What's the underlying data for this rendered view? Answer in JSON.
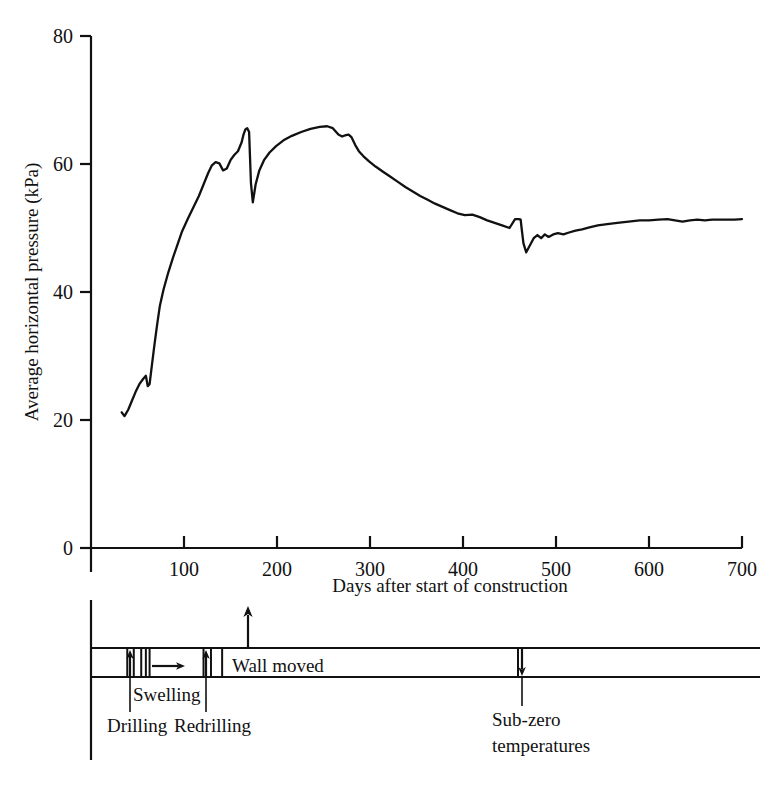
{
  "chart_data": {
    "type": "line",
    "title": "",
    "xlabel": "Days after start of construction",
    "ylabel": "Average horizontal pressure (kPa)",
    "xlim": [
      0,
      700
    ],
    "ylim": [
      0,
      80
    ],
    "xticks": [
      0,
      100,
      200,
      300,
      400,
      500,
      600,
      700
    ],
    "yticks": [
      0,
      20,
      40,
      60,
      80
    ],
    "xtick_labels": [
      "0",
      "100",
      "200",
      "300",
      "400",
      "500",
      "600",
      "700"
    ],
    "ytick_labels": [
      "0",
      "20",
      "40",
      "60",
      "80"
    ],
    "grid": false,
    "legend": false,
    "series": [
      {
        "name": "Average horizontal pressure",
        "color": "#111111",
        "x": [
          33,
          36,
          40,
          44,
          48,
          52,
          56,
          59,
          61,
          63,
          65,
          68,
          71,
          74,
          78,
          83,
          88,
          93,
          98,
          104,
          110,
          116,
          121,
          126,
          130,
          134,
          138,
          142,
          146,
          150,
          154,
          158,
          162,
          164,
          166,
          168,
          170,
          171,
          172,
          174,
          177,
          181,
          186,
          192,
          199,
          207,
          216,
          226,
          236,
          246,
          254,
          260,
          266,
          270,
          274,
          277,
          280,
          284,
          288,
          293,
          299,
          306,
          314,
          322,
          330,
          338,
          346,
          354,
          362,
          370,
          378,
          386,
          394,
          402,
          410,
          418,
          426,
          434,
          442,
          450,
          456,
          460,
          462,
          463,
          465,
          468,
          472,
          476,
          480,
          484,
          488,
          492,
          497,
          502,
          508,
          514,
          521,
          528,
          536,
          545,
          555,
          566,
          578,
          590,
          600,
          610,
          620,
          628,
          636,
          644,
          652,
          660,
          668,
          676,
          684,
          692,
          700
        ],
        "y": [
          21.2,
          20.6,
          21.6,
          23.0,
          24.4,
          25.6,
          26.4,
          26.9,
          25.3,
          25.6,
          28.0,
          31.5,
          34.8,
          37.8,
          40.4,
          43.0,
          45.3,
          47.4,
          49.5,
          51.4,
          53.2,
          55.0,
          56.8,
          58.6,
          59.8,
          60.3,
          60.1,
          59.0,
          59.3,
          60.6,
          61.4,
          62.0,
          63.4,
          64.6,
          65.4,
          65.6,
          65.0,
          61.0,
          57.0,
          54.0,
          56.8,
          59.0,
          60.6,
          61.8,
          62.8,
          63.7,
          64.4,
          65.0,
          65.5,
          65.8,
          65.9,
          65.6,
          64.6,
          64.3,
          64.5,
          64.6,
          64.2,
          63.0,
          62.0,
          61.2,
          60.4,
          59.6,
          58.8,
          58.0,
          57.2,
          56.4,
          55.7,
          55.0,
          54.4,
          53.8,
          53.3,
          52.8,
          52.3,
          52.0,
          52.1,
          51.7,
          51.2,
          50.8,
          50.4,
          50.0,
          51.4,
          51.4,
          51.3,
          50.0,
          47.6,
          46.2,
          47.3,
          48.4,
          48.9,
          48.4,
          49.0,
          48.6,
          49.0,
          49.2,
          49.0,
          49.3,
          49.6,
          49.8,
          50.1,
          50.4,
          50.6,
          50.8,
          51.0,
          51.2,
          51.2,
          51.3,
          51.4,
          51.2,
          51.0,
          51.2,
          51.3,
          51.2,
          51.3,
          51.3,
          51.3,
          51.3,
          51.4
        ]
      }
    ],
    "annotations": [
      {
        "label": "Drilling",
        "day": 42,
        "marker": "up-arrow"
      },
      {
        "label": "Swelling",
        "day": 62,
        "marker": "right-arrow"
      },
      {
        "label": "Redrilling",
        "day": 122,
        "marker": "up-arrow"
      },
      {
        "label": "Wall moved",
        "day": 169,
        "marker": "up-arrow"
      },
      {
        "label": "Sub-zero temperatures",
        "day": 465,
        "marker": "down-arrow"
      }
    ],
    "timeline": {
      "dividers_days": [
        0,
        39,
        46,
        54,
        59,
        63,
        121,
        129,
        141
      ],
      "bar_label_right": "Wall moved"
    }
  }
}
